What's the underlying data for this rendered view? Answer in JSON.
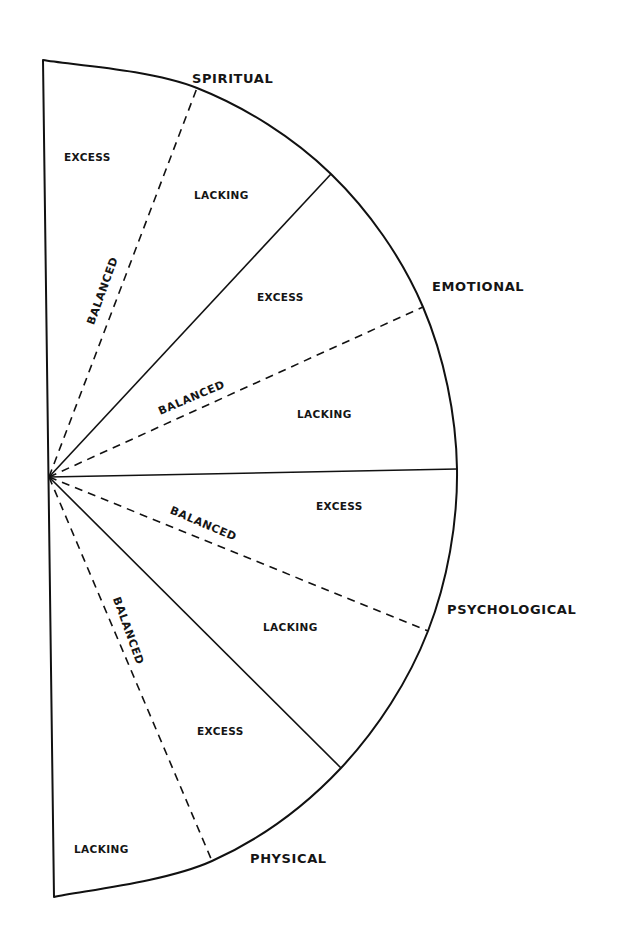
{
  "diagram": {
    "type": "half-circle segmented wheel",
    "center": [
      49,
      477
    ],
    "colors": {
      "ink": "#111111",
      "background": "#ffffff"
    },
    "dimensions": [
      {
        "id": "spiritual",
        "label": "SPIRITUAL",
        "label_pos": [
          192,
          83
        ]
      },
      {
        "id": "emotional",
        "label": "EMOTIONAL",
        "label_pos": [
          432,
          291
        ]
      },
      {
        "id": "psychological",
        "label": "PSYCHOLOGICAL",
        "label_pos": [
          447,
          614
        ]
      },
      {
        "id": "physical",
        "label": "PHYSICAL",
        "label_pos": [
          250,
          863
        ]
      }
    ],
    "zones": [
      {
        "dimension": "spiritual",
        "label": "EXCESS",
        "pos": [
          64,
          161
        ]
      },
      {
        "dimension": "spiritual",
        "label": "LACKING",
        "pos": [
          194,
          199
        ]
      },
      {
        "dimension": "emotional",
        "label": "EXCESS",
        "pos": [
          257,
          301
        ]
      },
      {
        "dimension": "emotional",
        "label": "LACKING",
        "pos": [
          297,
          418
        ]
      },
      {
        "dimension": "psychological",
        "label": "EXCESS",
        "pos": [
          316,
          510
        ]
      },
      {
        "dimension": "psychological",
        "label": "LACKING",
        "pos": [
          263,
          631
        ]
      },
      {
        "dimension": "physical",
        "label": "EXCESS",
        "pos": [
          197,
          735
        ]
      },
      {
        "dimension": "physical",
        "label": "LACKING",
        "pos": [
          74,
          853
        ]
      }
    ],
    "balanced_lines": [
      {
        "dimension": "spiritual",
        "label": "BALANCED",
        "pos": [
          106,
          292
        ],
        "rotate": -70
      },
      {
        "dimension": "emotional",
        "label": "BALANCED",
        "pos": [
          193,
          401
        ],
        "rotate": -23
      },
      {
        "dimension": "psychological",
        "label": "BALANCED",
        "pos": [
          202,
          527
        ],
        "rotate": 23
      },
      {
        "dimension": "physical",
        "label": "BALANCED",
        "pos": [
          125,
          632
        ],
        "rotate": 70
      }
    ],
    "solid_dividers": [
      [
        331,
        174
      ],
      [
        457,
        469
      ],
      [
        341,
        768
      ]
    ],
    "dashed_dividers": [
      [
        197,
        88
      ],
      [
        423,
        307
      ],
      [
        428,
        631
      ],
      [
        212,
        861
      ]
    ],
    "outline": {
      "top": [
        43,
        60
      ],
      "bottom": [
        54,
        897
      ],
      "arc_points": [
        [
          43,
          60
        ],
        [
          197,
          88
        ],
        [
          331,
          174
        ],
        [
          423,
          307
        ],
        [
          457,
          469
        ],
        [
          428,
          631
        ],
        [
          341,
          768
        ],
        [
          212,
          861
        ],
        [
          54,
          897
        ]
      ]
    }
  }
}
